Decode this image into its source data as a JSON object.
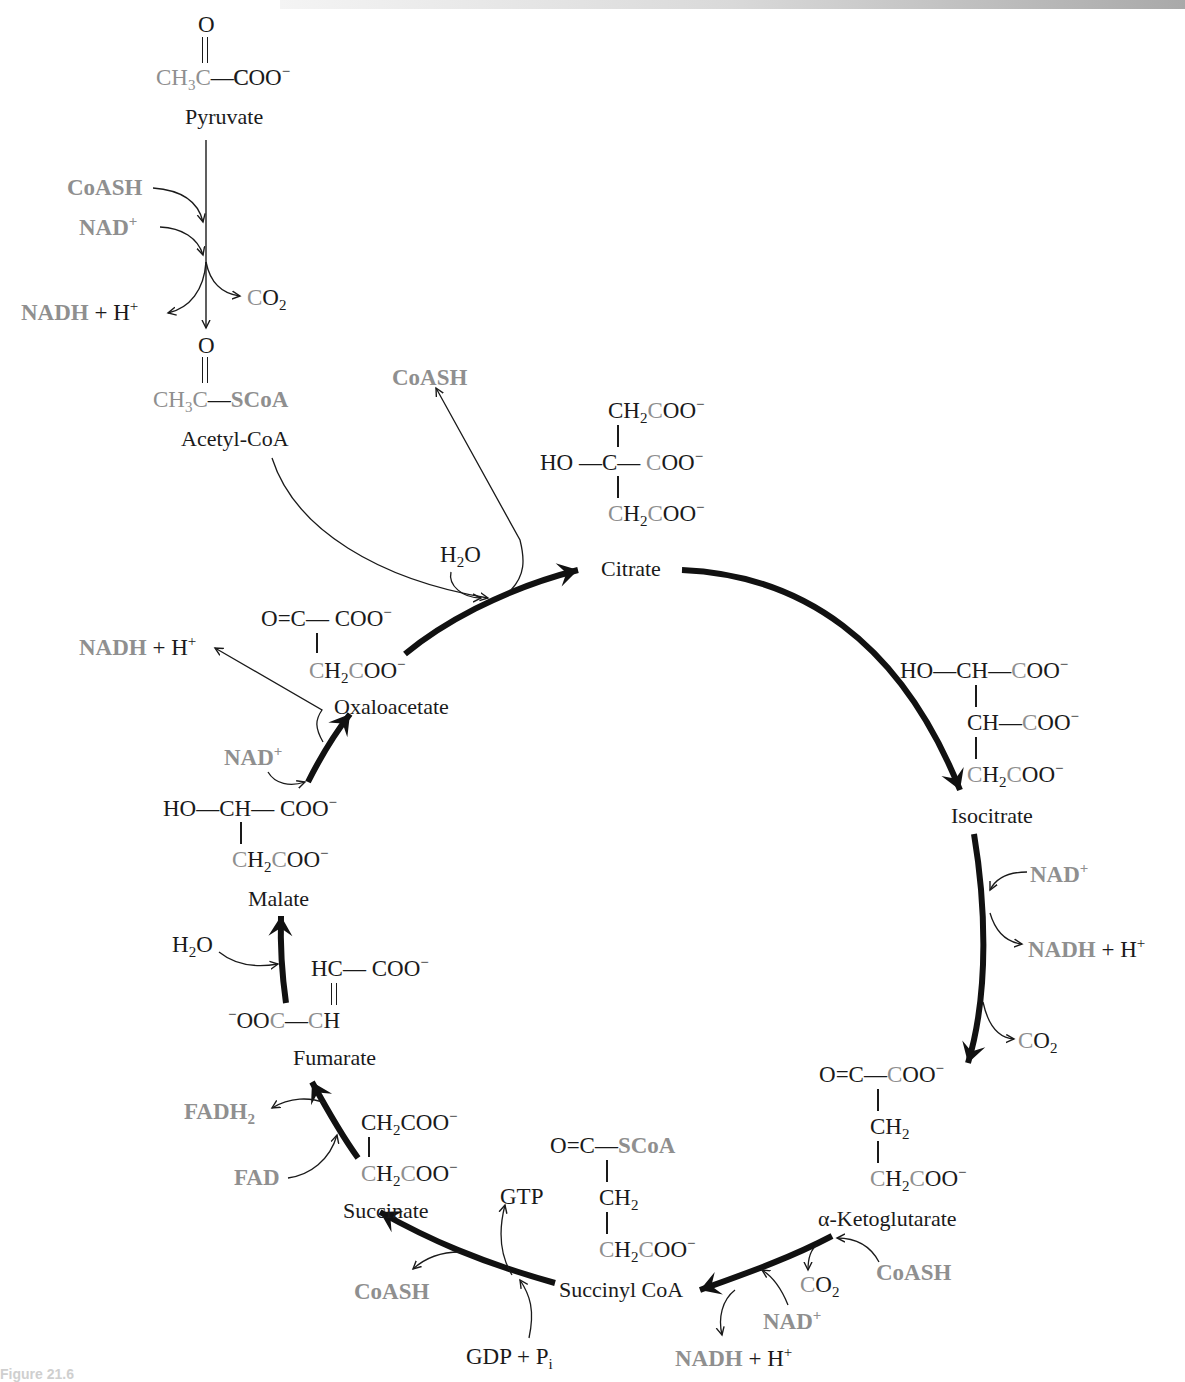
{
  "diagram": {
    "colors": {
      "cycle_arrow": "#111111",
      "cofactor_gray": "#8f8f8f",
      "text": "#1a1a1a",
      "background": "#ffffff"
    },
    "pyruvate_step": {
      "substrate": {
        "name": "Pyruvate",
        "formula_top": "O",
        "formula_main": [
          "CH",
          "3",
          "C",
          "—",
          "COO",
          "−"
        ]
      },
      "inputs": [
        "CoASH",
        "NAD+"
      ],
      "outputs": [
        "CO2",
        "NADH + H+"
      ],
      "product": {
        "name": "Acetyl-CoA",
        "formula_top": "O",
        "formula_main": [
          "CH",
          "3",
          "C",
          "—",
          "SCoA"
        ]
      }
    },
    "intermediates": [
      {
        "id": "citrate",
        "name": "Citrate",
        "formula": [
          "CH2COO−",
          "HO — C — COO−",
          "CH2COO−"
        ]
      },
      {
        "id": "isocitrate",
        "name": "Isocitrate",
        "formula": [
          "HO — CH — COO−",
          "CH — COO−",
          "CH2COO−"
        ]
      },
      {
        "id": "alpha-ketoglutarate",
        "name": "α-Ketoglutarate",
        "formula": [
          "O = C — COO−",
          "CH2",
          "CH2COO−"
        ]
      },
      {
        "id": "succinyl-coa",
        "name": "Succinyl CoA",
        "formula": [
          "O = C — SCoA",
          "CH2",
          "CH2COO−"
        ]
      },
      {
        "id": "succinate",
        "name": "Succinate",
        "formula": [
          "CH2COO−",
          "CH2COO−"
        ]
      },
      {
        "id": "fumarate",
        "name": "Fumarate",
        "formula": [
          "HC — COO−",
          "−OOC — CH"
        ]
      },
      {
        "id": "malate",
        "name": "Malate",
        "formula": [
          "HO — CH — COO−",
          "CH2COO−"
        ]
      },
      {
        "id": "oxaloacetate",
        "name": "Oxaloacetate",
        "formula": [
          "O = C — COO−",
          "CH2COO−"
        ]
      }
    ],
    "steps": [
      {
        "from": "oxaloacetate",
        "to": "citrate",
        "inputs": [
          "Acetyl-CoA",
          "H2O"
        ],
        "outputs": [
          "CoASH"
        ]
      },
      {
        "from": "citrate",
        "to": "isocitrate",
        "inputs": [],
        "outputs": []
      },
      {
        "from": "isocitrate",
        "to": "alpha-ketoglutarate",
        "inputs": [
          "NAD+"
        ],
        "outputs": [
          "NADH + H+",
          "CO2"
        ]
      },
      {
        "from": "alpha-ketoglutarate",
        "to": "succinyl-coa",
        "inputs": [
          "CoASH",
          "NAD+"
        ],
        "outputs": [
          "CO2",
          "NADH + H+"
        ]
      },
      {
        "from": "succinyl-coa",
        "to": "succinate",
        "inputs": [
          "GDP + Pi"
        ],
        "outputs": [
          "GTP",
          "CoASH"
        ]
      },
      {
        "from": "succinate",
        "to": "fumarate",
        "inputs": [
          "FAD"
        ],
        "outputs": [
          "FADH2"
        ]
      },
      {
        "from": "fumarate",
        "to": "malate",
        "inputs": [
          "H2O"
        ],
        "outputs": []
      },
      {
        "from": "malate",
        "to": "oxaloacetate",
        "inputs": [
          "NAD+"
        ],
        "outputs": [
          "NADH + H+"
        ]
      }
    ],
    "labels": {
      "O": "O",
      "CH": "CH",
      "C": "C",
      "H": "H",
      "HO": "HO",
      "HC": "HC",
      "COO": "COO",
      "OOC": "OOC",
      "minus": "−",
      "dash": "—",
      "eq": "=",
      "two": "2",
      "three": "3",
      "plus_sup": "+",
      "i": "i",
      "SCoA": "SCoA",
      "CoASH": "CoASH",
      "NAD": "NAD",
      "NADH": "NADH",
      "plus_H": " + H",
      "CO": "CO",
      "H2O_H": "H",
      "H2O_O": "O",
      "FAD": "FAD",
      "FADH": "FADH",
      "GTP": "GTP",
      "GDP_P": "GDP + P",
      "pyruvate": "Pyruvate",
      "acetyl_coa": "Acetyl-CoA",
      "citrate": "Citrate",
      "isocitrate": "Isocitrate",
      "akg": "α-Ketoglutarate",
      "succinyl_coa": "Succinyl CoA",
      "succinate": "Succinate",
      "fumarate": "Fumarate",
      "malate": "Malate",
      "oxaloacetate": "Oxaloacetate"
    },
    "caption_fragment": "Figure 21.6"
  }
}
